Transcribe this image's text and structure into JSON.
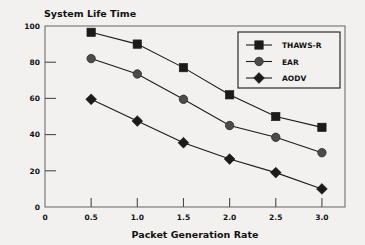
{
  "chart_data": {
    "type": "line",
    "title": "System Life Time",
    "xlabel": "Packet Generation Rate",
    "ylabel": "",
    "x": [
      0.5,
      1.0,
      1.5,
      2.0,
      2.5,
      3.0
    ],
    "xticklabels": [
      "0",
      "0.5",
      "1.0",
      "1.5",
      "2.0",
      "2.5",
      "3.0"
    ],
    "xtickvalues": [
      0.0,
      0.5,
      1.0,
      1.5,
      2.0,
      2.5,
      3.0
    ],
    "yticklabels": [
      "0",
      "20",
      "40",
      "60",
      "80",
      "100"
    ],
    "ytickvalues": [
      0,
      20,
      40,
      60,
      80,
      100
    ],
    "xlim": [
      0.0,
      3.25
    ],
    "ylim": [
      0,
      100
    ],
    "grid": false,
    "legend_position": "top-right",
    "series": [
      {
        "name": "THAWS-R",
        "marker": "square",
        "color": "#1b1b1b",
        "values": [
          96.5,
          90.0,
          77.0,
          62.0,
          50.0,
          44.0
        ]
      },
      {
        "name": "EAR",
        "marker": "circle",
        "color": "#4b4b4c",
        "values": [
          82.0,
          73.5,
          59.5,
          45.0,
          38.5,
          30.0
        ]
      },
      {
        "name": "AODV",
        "marker": "diamond",
        "color": "#1b1b1b",
        "values": [
          59.5,
          47.5,
          35.5,
          26.5,
          19.0,
          10.0
        ]
      }
    ]
  },
  "colors": {
    "background": "#f2f1ef",
    "frame": "#6f6f70",
    "ink": "#1b1b1b",
    "ear_marker": "#4b4b4c"
  }
}
